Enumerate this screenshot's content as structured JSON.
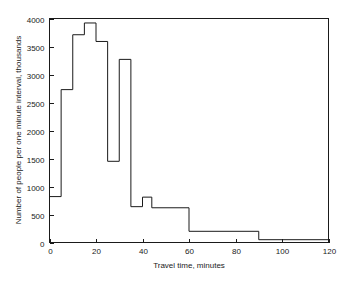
{
  "chart_data": {
    "type": "bar",
    "subtype": "step-histogram",
    "title": "",
    "xlabel": "Travel time, minutes",
    "ylabel": "Number of people per one minute interval, thousands",
    "xlim": [
      0,
      120
    ],
    "ylim": [
      0,
      4000
    ],
    "grid": false,
    "legend": null,
    "xticks": [
      0,
      20,
      40,
      60,
      80,
      100,
      120
    ],
    "xtick_labels": [
      "0",
      "20",
      "40",
      "60",
      "80",
      "100",
      "120"
    ],
    "yticks": [
      0,
      500,
      1000,
      1500,
      2000,
      2500,
      3000,
      3500,
      4000
    ],
    "ytick_labels": [
      "0",
      "500",
      "1000",
      "1500",
      "2000",
      "2500",
      "3000",
      "3500",
      "4000"
    ],
    "bin_edges": [
      0,
      5,
      10,
      15,
      20,
      25,
      30,
      35,
      40,
      44,
      60,
      90,
      120
    ],
    "values": [
      820,
      2730,
      3710,
      3920,
      3590,
      1450,
      3270,
      640,
      810,
      620,
      200,
      50
    ],
    "bins": [
      {
        "x0": 0,
        "x1": 5,
        "value": 820
      },
      {
        "x0": 5,
        "x1": 10,
        "value": 2730
      },
      {
        "x0": 10,
        "x1": 15,
        "value": 3710
      },
      {
        "x0": 15,
        "x1": 20,
        "value": 3920
      },
      {
        "x0": 20,
        "x1": 25,
        "value": 3590
      },
      {
        "x0": 25,
        "x1": 30,
        "value": 1450
      },
      {
        "x0": 30,
        "x1": 35,
        "value": 3270
      },
      {
        "x0": 35,
        "x1": 40,
        "value": 640
      },
      {
        "x0": 40,
        "x1": 44,
        "value": 810
      },
      {
        "x0": 44,
        "x1": 60,
        "value": 620
      },
      {
        "x0": 60,
        "x1": 90,
        "value": 200
      },
      {
        "x0": 90,
        "x1": 120,
        "value": 50
      }
    ],
    "colors": {
      "line": "#1a1a1a",
      "axis": "#1a1a1a",
      "background": "#ffffff"
    }
  }
}
